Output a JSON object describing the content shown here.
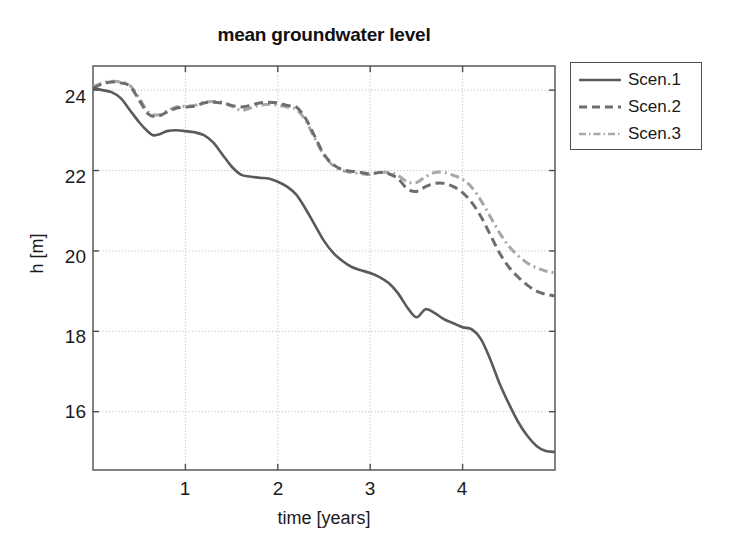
{
  "chart_data": {
    "type": "line",
    "title": "mean groundwater level",
    "xlabel": "time [years]",
    "ylabel": "h [m]",
    "xlim": [
      0,
      5.0
    ],
    "ylim": [
      14.55,
      24.6
    ],
    "xticks": [
      1,
      2,
      3,
      4
    ],
    "yticks": [
      16,
      18,
      20,
      22,
      24
    ],
    "grid": true,
    "legend_position": "outside-top-right",
    "series": [
      {
        "name": "Scen.1",
        "style": "solid",
        "color": "#5a5a5a",
        "x": [
          0.0,
          0.1,
          0.2,
          0.3,
          0.4,
          0.5,
          0.58,
          0.65,
          0.72,
          0.8,
          0.9,
          1.0,
          1.1,
          1.2,
          1.3,
          1.4,
          1.5,
          1.6,
          1.7,
          1.8,
          1.9,
          2.0,
          2.1,
          2.2,
          2.3,
          2.4,
          2.5,
          2.6,
          2.7,
          2.8,
          2.9,
          3.0,
          3.1,
          3.2,
          3.3,
          3.4,
          3.5,
          3.6,
          3.7,
          3.8,
          3.9,
          4.0,
          4.1,
          4.2,
          4.3,
          4.4,
          4.5,
          4.6,
          4.7,
          4.8,
          4.9,
          5.0
        ],
        "y": [
          24.05,
          24.0,
          23.95,
          23.8,
          23.5,
          23.2,
          23.0,
          22.88,
          22.9,
          22.98,
          23.0,
          22.98,
          22.95,
          22.88,
          22.7,
          22.4,
          22.1,
          21.9,
          21.85,
          21.82,
          21.8,
          21.72,
          21.6,
          21.4,
          21.05,
          20.65,
          20.25,
          19.95,
          19.75,
          19.6,
          19.52,
          19.45,
          19.35,
          19.2,
          18.95,
          18.6,
          18.35,
          18.55,
          18.45,
          18.3,
          18.2,
          18.1,
          18.05,
          17.8,
          17.3,
          16.7,
          16.2,
          15.75,
          15.4,
          15.15,
          15.02,
          15.0
        ]
      },
      {
        "name": "Scen.2",
        "style": "dashed",
        "color": "#6e6e6e",
        "x": [
          0.0,
          0.1,
          0.2,
          0.3,
          0.4,
          0.5,
          0.6,
          0.7,
          0.8,
          0.9,
          1.0,
          1.1,
          1.2,
          1.3,
          1.4,
          1.5,
          1.6,
          1.7,
          1.8,
          1.9,
          2.0,
          2.1,
          2.2,
          2.3,
          2.4,
          2.5,
          2.6,
          2.7,
          2.8,
          2.9,
          3.0,
          3.1,
          3.2,
          3.3,
          3.4,
          3.5,
          3.6,
          3.7,
          3.8,
          3.9,
          4.0,
          4.1,
          4.2,
          4.3,
          4.4,
          4.5,
          4.6,
          4.7,
          4.8,
          4.9,
          5.0
        ],
        "y": [
          24.05,
          24.15,
          24.2,
          24.18,
          24.1,
          23.75,
          23.4,
          23.35,
          23.45,
          23.55,
          23.58,
          23.6,
          23.68,
          23.7,
          23.68,
          23.62,
          23.58,
          23.62,
          23.68,
          23.7,
          23.68,
          23.62,
          23.58,
          23.3,
          22.85,
          22.4,
          22.15,
          22.02,
          21.98,
          21.95,
          21.92,
          21.95,
          21.92,
          21.8,
          21.55,
          21.48,
          21.6,
          21.68,
          21.68,
          21.6,
          21.45,
          21.2,
          20.85,
          20.4,
          19.95,
          19.6,
          19.35,
          19.15,
          19.0,
          18.92,
          18.88
        ]
      },
      {
        "name": "Scen.3",
        "style": "dashdot",
        "color": "#a8a8a8",
        "x": [
          0.0,
          0.1,
          0.2,
          0.3,
          0.4,
          0.5,
          0.6,
          0.7,
          0.8,
          0.9,
          1.0,
          1.1,
          1.2,
          1.3,
          1.4,
          1.5,
          1.6,
          1.7,
          1.8,
          1.9,
          2.0,
          2.1,
          2.2,
          2.3,
          2.4,
          2.5,
          2.6,
          2.7,
          2.8,
          2.9,
          3.0,
          3.1,
          3.2,
          3.3,
          3.4,
          3.5,
          3.6,
          3.7,
          3.8,
          3.9,
          4.0,
          4.1,
          4.2,
          4.3,
          4.4,
          4.5,
          4.6,
          4.7,
          4.8,
          4.9,
          5.0
        ],
        "y": [
          24.08,
          24.18,
          24.22,
          24.2,
          24.12,
          23.8,
          23.45,
          23.38,
          23.48,
          23.58,
          23.6,
          23.62,
          23.7,
          23.72,
          23.7,
          23.6,
          23.5,
          23.55,
          23.62,
          23.65,
          23.62,
          23.58,
          23.52,
          23.25,
          22.8,
          22.38,
          22.12,
          22.0,
          21.95,
          21.92,
          21.9,
          21.95,
          21.95,
          21.88,
          21.72,
          21.7,
          21.85,
          21.95,
          21.95,
          21.88,
          21.78,
          21.58,
          21.25,
          20.85,
          20.45,
          20.12,
          19.88,
          19.7,
          19.58,
          19.5,
          19.45
        ]
      }
    ]
  },
  "axes": {
    "yticks_labels": [
      "24",
      "22",
      "20",
      "18",
      "16"
    ],
    "xticks_labels": [
      "1",
      "2",
      "3",
      "4"
    ]
  },
  "legend": {
    "entries": [
      {
        "label": "Scen.1",
        "style": "solid"
      },
      {
        "label": "Scen.2",
        "style": "dashed"
      },
      {
        "label": "Scen.3",
        "style": "dashdot"
      }
    ]
  },
  "colors": {
    "series1": "#5a5a5a",
    "series2": "#6e6e6e",
    "series3": "#a8a8a8",
    "axis": "#4d4d4d",
    "grid": "#bdbdbd",
    "text": "#1a1a1a"
  }
}
